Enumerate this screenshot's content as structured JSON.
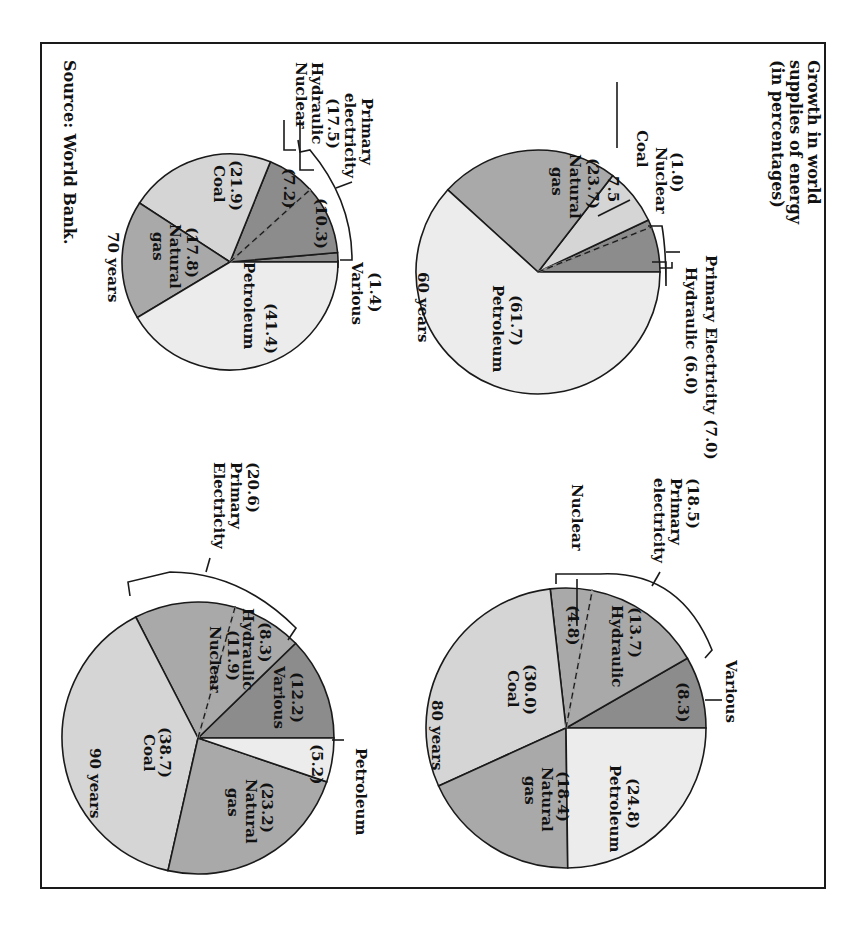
{
  "title": [
    "Growth in world",
    "supplies of energy",
    "(in percentages)"
  ],
  "source": "Source: World Bank.",
  "colors": {
    "dark": "#8c8c8c",
    "medium": "#a9a9a9",
    "light": "#d5d5d5",
    "very_light": "#ececec",
    "stroke": "#1a1a1a",
    "frame": "#1a1a1a"
  },
  "chart_data": [
    {
      "type": "pie",
      "title": "60 years",
      "categories": [
        "Hydraulic",
        "Nuclear",
        "Coal",
        "Natural gas",
        "Petroleum"
      ],
      "values": [
        6.0,
        1.0,
        7.5,
        23.7,
        61.7
      ],
      "groups": [
        {
          "name": "Primary Electricity",
          "value": 7.0,
          "members": [
            "Hydraulic",
            "Nuclear"
          ]
        }
      ]
    },
    {
      "type": "pie",
      "title": "70 years",
      "categories": [
        "Various",
        "Hydraulic",
        "Nuclear",
        "Coal",
        "Natural gas",
        "Petroleum"
      ],
      "values": [
        1.4,
        10.3,
        7.2,
        21.9,
        17.8,
        41.4
      ],
      "groups": [
        {
          "name": "Primary electricity",
          "value": 17.5,
          "members": [
            "Hydraulic",
            "Nuclear"
          ]
        }
      ]
    },
    {
      "type": "pie",
      "title": "80 years",
      "categories": [
        "Various",
        "Hydraulic",
        "Nuclear",
        "Coal",
        "Natural gas",
        "Petroleum"
      ],
      "values": [
        8.3,
        13.7,
        4.8,
        30.0,
        18.4,
        24.8
      ],
      "groups": [
        {
          "name": "Primary electricity",
          "value": 18.5,
          "members": [
            "Hydraulic",
            "Nuclear"
          ]
        }
      ]
    },
    {
      "type": "pie",
      "title": "90 years",
      "categories": [
        "Various",
        "Hydraulic",
        "Nuclear",
        "Coal",
        "Natural gas",
        "Petroleum"
      ],
      "values": [
        12.2,
        8.3,
        11.9,
        38.7,
        23.2,
        5.2
      ],
      "groups": [
        {
          "name": "Primary Electricity",
          "value": 20.6,
          "members": [
            "Hydraulic",
            "Nuclear"
          ]
        }
      ]
    }
  ],
  "labels": {
    "p60": {
      "year": "60 years",
      "primary": "Primary Electricity (7.0)",
      "hydraulic": "Hydraulic (6.0)",
      "nuclear_val": "(1.0)",
      "nuclear": "Nuclear",
      "coal": "Coal",
      "coal_val": "7.5",
      "gas_val": "(23.7)",
      "gas1": "Natural",
      "gas2": "gas",
      "pet_val": "(61.7)",
      "pet": "Petroleum"
    },
    "p70": {
      "year": "70 years",
      "primary1": "Primary",
      "primary2": "electricity",
      "primary3": "(17.5)",
      "hydraulic": "Hydraulic",
      "nuclear": "Nuclear",
      "various_val": "(1.4)",
      "various": "Various",
      "hyd_val": "(10.3)",
      "nuc_val": "(7.2)",
      "coal_val": "(21.9)",
      "coal": "Coal",
      "gas_val": "(17.8)",
      "gas1": "Natural",
      "gas2": "gas",
      "pet_val": "(41.4)",
      "pet": "Petroleum"
    },
    "p80": {
      "year": "80 years",
      "primary0": "(18.5)",
      "primary1": "Primary",
      "primary2": "electricity",
      "nuclear": "Nuclear",
      "various": "Various",
      "var_val": "(8.3)",
      "hyd_val": "(13.7)",
      "hyd": "Hydraulic",
      "nuc_val": "(4.8)",
      "coal_val": "(30.0)",
      "coal": "Coal",
      "gas_val": "(18.4)",
      "gas1": "Natural",
      "gas2": "gas",
      "pet_val": "(24.8)",
      "pet": "Petroleum"
    },
    "p90": {
      "year": "90 years",
      "primary0": "(20.6)",
      "primary1": "Primary",
      "primary2": "Electricity",
      "petroleum": "Petroleum",
      "pet_val": "(5.2)",
      "var_val": "(12.2)",
      "var": "Various",
      "hyd_val": "(8.3)",
      "hyd": "Hydraulic",
      "nuc_val": "(11.9)",
      "nuc": "Nuclear",
      "coal_val": "(38.7)",
      "coal": "Coal",
      "gas_val": "(23.2)",
      "gas1": "Natural",
      "gas2": "gas"
    }
  }
}
